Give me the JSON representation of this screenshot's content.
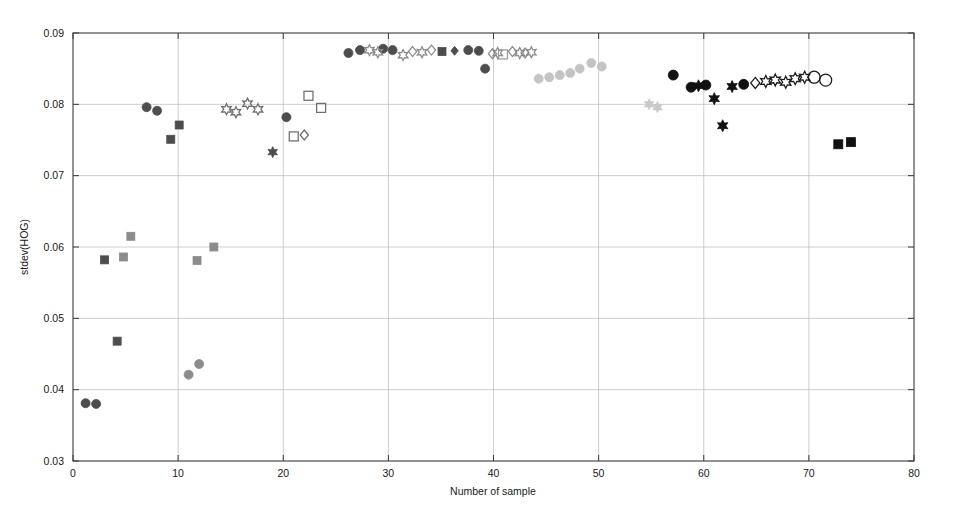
{
  "figure": {
    "background_color": "#ffffff",
    "frame_color": "#3a3a3a",
    "grid_color": "#b9b9b9"
  },
  "axes": {
    "x": {
      "label": "Number of sample",
      "min": 0,
      "max": 80,
      "ticks": [
        0,
        10,
        20,
        30,
        40,
        50,
        60,
        70,
        80
      ],
      "tick_labels": [
        "0",
        "10",
        "20",
        "30",
        "40",
        "50",
        "60",
        "70",
        "80"
      ]
    },
    "y": {
      "label": "stdev(HOG)",
      "min": 0.03,
      "max": 0.09,
      "ticks": [
        0.03,
        0.04,
        0.05,
        0.06,
        0.07,
        0.08,
        0.09
      ],
      "tick_labels": [
        "0.03",
        "0.04",
        "0.05",
        "0.06",
        "0.07",
        "0.08",
        "0.09"
      ]
    }
  },
  "chart_data": {
    "type": "scatter",
    "title": "",
    "xlabel": "Number of sample",
    "ylabel": "stdev(HOG)",
    "xlim": [
      0,
      80
    ],
    "ylim": [
      0.03,
      0.09
    ],
    "grid": true,
    "legend": "none",
    "series": [
      {
        "name": "dark-circle",
        "marker": "circle",
        "filled": true,
        "color": "#4d4d4d",
        "size": 9,
        "points": [
          [
            1.2,
            0.0381
          ],
          [
            2.2,
            0.038
          ],
          [
            7.0,
            0.0796
          ],
          [
            8.0,
            0.0791
          ],
          [
            20.3,
            0.0782
          ],
          [
            26.2,
            0.0872
          ],
          [
            27.3,
            0.0876
          ],
          [
            29.5,
            0.0878
          ],
          [
            30.4,
            0.0876
          ],
          [
            37.6,
            0.0876
          ],
          [
            38.6,
            0.0875
          ],
          [
            39.2,
            0.085
          ]
        ]
      },
      {
        "name": "dark-square",
        "marker": "square",
        "filled": true,
        "color": "#4d4d4d",
        "size": 8,
        "points": [
          [
            3.0,
            0.0582
          ],
          [
            4.2,
            0.0468
          ],
          [
            9.3,
            0.0751
          ],
          [
            10.1,
            0.0771
          ],
          [
            35.1,
            0.0874
          ]
        ]
      },
      {
        "name": "dark-star",
        "marker": "hexagram",
        "filled": true,
        "color": "#4d4d4d",
        "size": 9,
        "points": [
          [
            19.0,
            0.0733
          ]
        ]
      },
      {
        "name": "dark-diamond",
        "marker": "diamond",
        "filled": true,
        "color": "#4d4d4d",
        "size": 9,
        "points": [
          [
            36.3,
            0.0875
          ]
        ]
      },
      {
        "name": "mid-gray-square",
        "marker": "square",
        "filled": true,
        "color": "#8c8c8c",
        "size": 8,
        "points": [
          [
            4.8,
            0.0586
          ],
          [
            5.5,
            0.0615
          ],
          [
            11.8,
            0.0581
          ],
          [
            13.4,
            0.06
          ]
        ]
      },
      {
        "name": "mid-gray-circle",
        "marker": "circle",
        "filled": true,
        "color": "#8c8c8c",
        "size": 9,
        "points": [
          [
            11.0,
            0.0421
          ],
          [
            12.0,
            0.0436
          ]
        ]
      },
      {
        "name": "open-star-left",
        "marker": "hexagram",
        "filled": false,
        "color": "#6e6e6e",
        "size": 9,
        "points": [
          [
            14.6,
            0.0793
          ],
          [
            15.5,
            0.0789
          ],
          [
            16.6,
            0.0801
          ],
          [
            17.6,
            0.0793
          ]
        ]
      },
      {
        "name": "open-square-left",
        "marker": "square",
        "filled": false,
        "color": "#6e6e6e",
        "size": 9,
        "points": [
          [
            21.0,
            0.0755
          ],
          [
            22.4,
            0.0812
          ],
          [
            23.6,
            0.0795
          ]
        ]
      },
      {
        "name": "open-diamond-left",
        "marker": "diamond",
        "filled": false,
        "color": "#6e6e6e",
        "size": 10,
        "points": [
          [
            22.0,
            0.0757
          ]
        ]
      },
      {
        "name": "open-star-mid",
        "marker": "hexagram",
        "filled": false,
        "color": "#8a8a8a",
        "size": 9,
        "points": [
          [
            28.2,
            0.0876
          ],
          [
            29.0,
            0.0873
          ],
          [
            31.4,
            0.0869
          ],
          [
            33.2,
            0.0873
          ],
          [
            40.4,
            0.0872
          ],
          [
            42.5,
            0.0872
          ],
          [
            43.6,
            0.0873
          ]
        ]
      },
      {
        "name": "open-diamond-mid",
        "marker": "diamond",
        "filled": false,
        "color": "#8a8a8a",
        "size": 10,
        "points": [
          [
            32.3,
            0.0874
          ],
          [
            34.1,
            0.0876
          ],
          [
            39.9,
            0.0871
          ],
          [
            41.8,
            0.0874
          ],
          [
            43.0,
            0.0872
          ]
        ]
      },
      {
        "name": "open-square-mid",
        "marker": "square",
        "filled": false,
        "color": "#9a9a9a",
        "size": 9,
        "points": [
          [
            40.9,
            0.087
          ]
        ]
      },
      {
        "name": "light-gray-circle",
        "marker": "circle",
        "filled": true,
        "color": "#c4c4c4",
        "size": 9,
        "points": [
          [
            44.3,
            0.0836
          ],
          [
            45.3,
            0.0838
          ],
          [
            46.3,
            0.0841
          ],
          [
            47.3,
            0.0844
          ],
          [
            48.2,
            0.085
          ],
          [
            49.3,
            0.0858
          ],
          [
            50.3,
            0.0853
          ]
        ]
      },
      {
        "name": "light-gray-star",
        "marker": "hexagram",
        "filled": true,
        "color": "#c9c9c9",
        "size": 9,
        "points": [
          [
            54.8,
            0.08
          ],
          [
            55.6,
            0.0796
          ]
        ]
      },
      {
        "name": "black-circle",
        "marker": "circle",
        "filled": true,
        "color": "#111111",
        "size": 10,
        "points": [
          [
            57.1,
            0.0841
          ],
          [
            58.8,
            0.0824
          ],
          [
            60.2,
            0.0827
          ],
          [
            63.8,
            0.0828
          ]
        ]
      },
      {
        "name": "black-star",
        "marker": "hexagram",
        "filled": true,
        "color": "#111111",
        "size": 10,
        "points": [
          [
            59.5,
            0.0826
          ],
          [
            61.0,
            0.0808
          ],
          [
            61.8,
            0.077
          ],
          [
            62.7,
            0.0825
          ]
        ]
      },
      {
        "name": "black-square",
        "marker": "square",
        "filled": true,
        "color": "#111111",
        "size": 9,
        "points": [
          [
            72.8,
            0.0744
          ],
          [
            74.0,
            0.0747
          ]
        ]
      },
      {
        "name": "open-diamond-right",
        "marker": "diamond",
        "filled": false,
        "color": "#1a1a1a",
        "size": 11,
        "points": [
          [
            64.9,
            0.083
          ]
        ]
      },
      {
        "name": "open-star-right",
        "marker": "hexagram",
        "filled": false,
        "color": "#1a1a1a",
        "size": 10,
        "points": [
          [
            65.9,
            0.0832
          ],
          [
            66.8,
            0.0834
          ],
          [
            67.8,
            0.0831
          ],
          [
            68.7,
            0.0836
          ],
          [
            69.6,
            0.0838
          ]
        ]
      },
      {
        "name": "open-circle-right",
        "marker": "circle",
        "filled": false,
        "color": "#1a1a1a",
        "size": 12,
        "points": [
          [
            70.5,
            0.0838
          ],
          [
            71.6,
            0.0834
          ]
        ]
      }
    ]
  }
}
